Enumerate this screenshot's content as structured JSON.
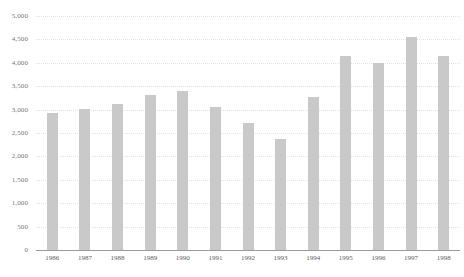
{
  "chart_data": {
    "type": "bar",
    "title": "",
    "subtitle": "",
    "xlabel": "",
    "ylabel": "",
    "categories": [
      "1986",
      "1987",
      "1988",
      "1989",
      "1990",
      "1991",
      "1992",
      "1993",
      "1994",
      "1995",
      "1996",
      "1997",
      "1998"
    ],
    "values": [
      2920,
      3020,
      3110,
      3310,
      3400,
      3050,
      2715,
      2370,
      3280,
      4155,
      4000,
      4545,
      4150
    ],
    "series": [
      {
        "name": "",
        "values": [
          2920,
          3020,
          3110,
          3310,
          3400,
          3050,
          2715,
          2370,
          3280,
          4155,
          4000,
          4545,
          4150
        ]
      }
    ],
    "ylim": [
      0,
      5000
    ],
    "ytick_step": 500,
    "ytick_values": [
      0,
      500,
      1000,
      1500,
      2000,
      2500,
      3000,
      3500,
      4000,
      4500,
      5000
    ],
    "ytick_labels": [
      "0",
      "500",
      "1,000",
      "1,500",
      "2,000",
      "2,500",
      "3,000",
      "3,500",
      "4,000",
      "4,500",
      "5,000"
    ],
    "grid": true,
    "grid_style": "dotted-horizontal",
    "legend": false,
    "legend_position": "none",
    "bar_color": "#c9c9c9",
    "grid_color": "#e2e2e2",
    "axis_color": "#9a9a9a",
    "label_color": "#5d5d5d",
    "tick_label_color": "#777777",
    "background": "#ffffff",
    "annotations": []
  }
}
